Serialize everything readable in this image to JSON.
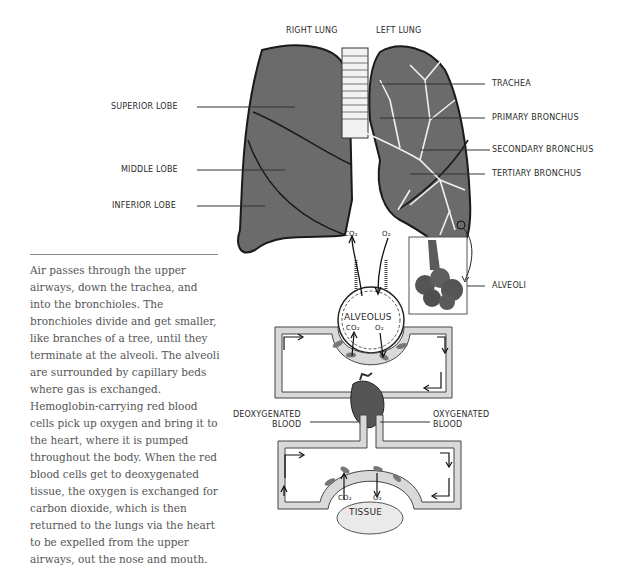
{
  "lung_labels": {
    "right_lung": "RIGHT LUNG",
    "left_lung": "LEFT LUNG",
    "superior_lobe": "SUPERIOR LOBE",
    "middle_lobe": "MIDDLE LOBE",
    "inferior_lobe": "INFERIOR LOBE",
    "trachea": "TRACHEA",
    "primary_bronchus": "PRIMARY BRONCHUS",
    "secondary_bronchus": "SECONDARY BRONCHUS",
    "tertiary_bronchus": "TERTIARY BRONCHUS",
    "alveoli": "ALVEOLI"
  },
  "circulation_labels": {
    "top_co2": "CO₂",
    "top_o2": "O₂",
    "alveolus": "ALVEOLUS",
    "alveolus_co2": "CO₂",
    "alveolus_o2": "O₂",
    "deoxygenated_1": "DEOXYGENATED",
    "deoxygenated_2": "BLOOD",
    "oxygenated_1": "OXYGENATED",
    "oxygenated_2": "BLOOD",
    "tissue_co2": "CO₂",
    "tissue_o2": "O₂",
    "tissue": "TISSUE"
  },
  "description": "Air passes through the upper airways, down the trachea, and into the bronchioles. The bronchioles divide and get smaller, like branches of a tree, until they terminate at the alveoli. The alveoli are surrounded by capillary beds where gas is exchanged. Hemoglobin-carrying red blood cells pick up oxygen and bring it to the heart, where it is pumped throughout the body. When the red blood cells get to deoxygenated tissue, the oxygen is exchanged for carbon dioxide, which is then returned to the lungs via the heart to be expelled from the upper airways, out the nose and mouth.",
  "colors": {
    "lung_fill": "#6b6b6b",
    "outline": "#1a1a1a",
    "vessel_fill": "#d9d9d9",
    "text": "#2a2a2a",
    "paragraph_text": "#555555"
  }
}
